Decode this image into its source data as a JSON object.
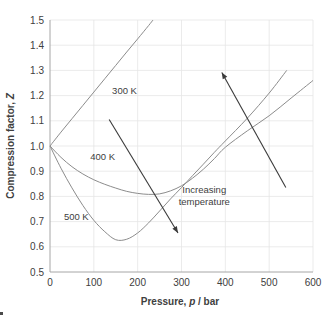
{
  "chart_data": {
    "type": "line",
    "title": "",
    "xlabel": "Pressure, p / bar",
    "xlabel_plain": "Pressure,",
    "xlabel_italic": "p",
    "xlabel_tail": "/ bar",
    "ylabel": "Compression factor, Z",
    "ylabel_plain": "Compression factor,",
    "ylabel_italic": "Z",
    "xlim": [
      0,
      600
    ],
    "ylim": [
      0.5,
      1.5
    ],
    "xticks": [
      0,
      100,
      200,
      300,
      400,
      500,
      600
    ],
    "yticks": [
      0.5,
      0.6,
      0.7,
      0.8,
      0.9,
      1.0,
      1.1,
      1.2,
      1.3,
      1.4,
      1.5
    ],
    "xtick_labels": [
      "0",
      "100",
      "200",
      "300",
      "400",
      "500",
      "600"
    ],
    "ytick_labels": [
      "0.5",
      "0.6",
      "0.7",
      "0.8",
      "0.9",
      "1.0",
      "1.1",
      "1.2",
      "1.3",
      "1.4",
      "1.5"
    ],
    "grid": true,
    "legend_position": "inline-labels",
    "curve_color": "#8c8c8c",
    "grid_color": "#e6e6e6",
    "axis_color": "#a6a6a6",
    "annotation_color": "#3a3a3a",
    "series": [
      {
        "name": "300 K",
        "label": "300 K",
        "label_at": {
          "p": 170,
          "Z": 1.205
        },
        "x": [
          0,
          25,
          50,
          75,
          100,
          125,
          150,
          175,
          200,
          225,
          235
        ],
        "values": [
          1.0,
          1.055,
          1.108,
          1.161,
          1.214,
          1.267,
          1.32,
          1.373,
          1.425,
          1.478,
          1.5
        ]
      },
      {
        "name": "400 K",
        "label": "400 K",
        "label_at": {
          "p": 120,
          "Z": 0.945
        },
        "x": [
          0,
          25,
          50,
          75,
          100,
          125,
          150,
          175,
          200,
          225,
          250,
          275,
          300,
          325,
          350,
          375,
          400,
          450,
          500,
          550,
          600
        ],
        "values": [
          1.0,
          0.955,
          0.918,
          0.889,
          0.866,
          0.848,
          0.833,
          0.82,
          0.812,
          0.808,
          0.81,
          0.822,
          0.842,
          0.872,
          0.908,
          0.95,
          0.995,
          1.06,
          1.12,
          1.19,
          1.26
        ]
      },
      {
        "name": "500 K",
        "label": "500 K",
        "label_at": {
          "p": 60,
          "Z": 0.705
        },
        "x": [
          0,
          25,
          50,
          75,
          100,
          125,
          150,
          175,
          200,
          225,
          250,
          275,
          300,
          325,
          350,
          375,
          400,
          450,
          500,
          540
        ],
        "values": [
          1.0,
          0.912,
          0.834,
          0.764,
          0.705,
          0.66,
          0.628,
          0.63,
          0.655,
          0.695,
          0.742,
          0.79,
          0.835,
          0.882,
          0.928,
          0.975,
          1.02,
          1.11,
          1.21,
          1.3
        ]
      }
    ],
    "annotations": [
      {
        "name": "increasing-temperature-label",
        "text_line1": "Increasing",
        "text_line2": "temperature",
        "at": {
          "p": 352,
          "Z": 0.815
        }
      },
      {
        "name": "left-arrow",
        "from": {
          "p": 135,
          "Z": 1.105
        },
        "to": {
          "p": 292,
          "Z": 0.655
        }
      },
      {
        "name": "right-arrow",
        "from": {
          "p": 538,
          "Z": 0.835
        },
        "to": {
          "p": 392,
          "Z": 1.292
        }
      }
    ]
  }
}
